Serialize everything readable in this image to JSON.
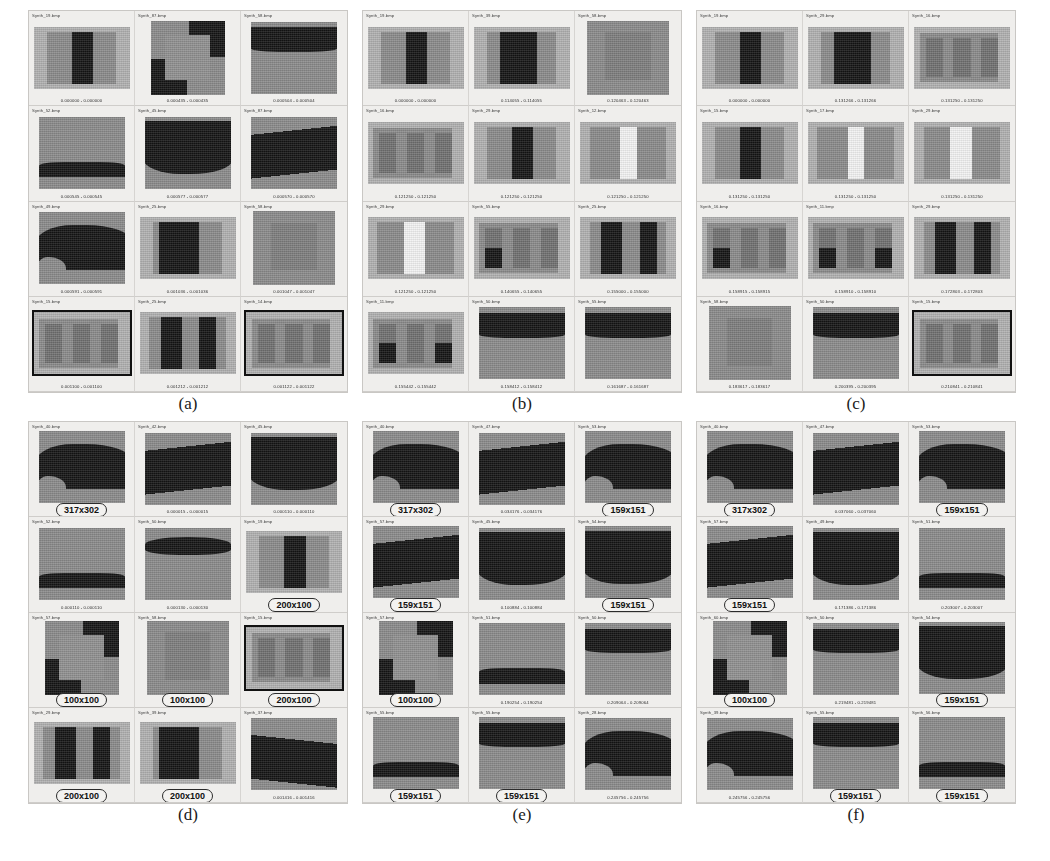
{
  "figure": {
    "colors": {
      "page_background": "#ffffff",
      "panel_background": "#efeeec",
      "panel_border": "#c9c7c4",
      "image_background": "#b0b0b0",
      "region_mid": "#8a8a8a",
      "region_dark": "#141414",
      "region_white": "#f2f2f2",
      "callout_border": "#2b2b2b",
      "selection_border": "#111111"
    },
    "panels": [
      {
        "caption": "(a)",
        "cells": [
          {
            "name": "Synth_19.bmp",
            "score": "0.000000 - 0.000000",
            "pattern": "stripe-dark-center",
            "selected": false
          },
          {
            "name": "Synth_87.bmp",
            "score": "0.000435 - 0.000435",
            "pattern": "bevel-frame",
            "selected": false
          },
          {
            "name": "Synth_58.bmp",
            "score": "0.000504 - 0.000504",
            "pattern": "band-top-dark",
            "selected": false
          },
          {
            "name": "Synth_52.bmp",
            "score": "0.000545 - 0.000545",
            "pattern": "band-lower-dark",
            "selected": false
          },
          {
            "name": "Synth_45.bmp",
            "score": "0.000577 - 0.000577",
            "pattern": "wave-top-dark",
            "selected": false
          },
          {
            "name": "Synth_87.bmp",
            "score": "0.000570 - 0.000570",
            "pattern": "diag-dark-upper",
            "selected": false
          },
          {
            "name": "Synth_49.bmp",
            "score": "0.000591 - 0.000591",
            "pattern": "wave-blob-dark",
            "selected": false
          },
          {
            "name": "Synth_25.bmp",
            "score": "0.001036 - 0.001036",
            "pattern": "stripe-dark-left",
            "selected": false
          },
          {
            "name": "Synth_58.bmp",
            "score": "0.001047 - 0.001047",
            "pattern": "center-square",
            "selected": false
          },
          {
            "name": "Synth_15.bmp",
            "score": "0.001100 - 0.001100",
            "pattern": "three-stripes",
            "selected": true
          },
          {
            "name": "Synth_25.bmp",
            "score": "0.001212 - 0.001212",
            "pattern": "two-dark-bars",
            "selected": false
          },
          {
            "name": "Synth_14.bmp",
            "score": "0.001122 - 0.001122",
            "pattern": "three-stripes",
            "selected": true
          }
        ]
      },
      {
        "caption": "(b)",
        "cells": [
          {
            "name": "Synth_19.bmp",
            "score": "0.000000 - 0.000000",
            "pattern": "stripe-dark-center",
            "selected": false
          },
          {
            "name": "Synth_39.bmp",
            "score": "0.114055 - 0.114055",
            "pattern": "stripe-dark-wide",
            "selected": false
          },
          {
            "name": "Synth_58.bmp",
            "score": "0.120463 - 0.120463",
            "pattern": "center-square",
            "selected": false
          },
          {
            "name": "Synth_16.bmp",
            "score": "0.121250 - 0.121250",
            "pattern": "three-stripes",
            "selected": false
          },
          {
            "name": "Synth_29.bmp",
            "score": "0.121250 - 0.121250",
            "pattern": "stripe-dark-center",
            "selected": false
          },
          {
            "name": "Synth_12.bmp",
            "score": "0.121250 - 0.121250",
            "pattern": "stripe-white-center",
            "selected": false
          },
          {
            "name": "Synth_29.bmp",
            "score": "0.121250 - 0.121250",
            "pattern": "stripe-white-wide",
            "selected": false
          },
          {
            "name": "Synth_55.bmp",
            "score": "0.140655 - 0.140655",
            "pattern": "three-stripes-corner",
            "selected": false
          },
          {
            "name": "Synth_25.bmp",
            "score": "0.155000 - 0.155000",
            "pattern": "two-dark-bars",
            "selected": false
          },
          {
            "name": "Synth_11.bmp",
            "score": "0.155442 - 0.155442",
            "pattern": "three-stripes-split",
            "selected": false
          },
          {
            "name": "Synth_50.bmp",
            "score": "0.158412 - 0.158412",
            "pattern": "band-top-dark",
            "selected": false
          },
          {
            "name": "Synth_55.bmp",
            "score": "0.161687 - 0.161687",
            "pattern": "band-top-dark",
            "selected": false
          }
        ]
      },
      {
        "caption": "(c)",
        "cells": [
          {
            "name": "Synth_19.bmp",
            "score": "0.000000 - 0.000000",
            "pattern": "stripe-dark-center",
            "selected": false
          },
          {
            "name": "Synth_29.bmp",
            "score": "0.131266 - 0.131266",
            "pattern": "stripe-dark-wide",
            "selected": false
          },
          {
            "name": "Synth_16.bmp",
            "score": "0.131250 - 0.131250",
            "pattern": "three-stripes",
            "selected": false
          },
          {
            "name": "Synth_15.bmp",
            "score": "0.131250 - 0.131250",
            "pattern": "stripe-dark-center",
            "selected": false
          },
          {
            "name": "Synth_17.bmp",
            "score": "0.131250 - 0.131250",
            "pattern": "stripe-white-center",
            "selected": false
          },
          {
            "name": "Synth_29.bmp",
            "score": "0.131250 - 0.131250",
            "pattern": "stripe-white-wide",
            "selected": false
          },
          {
            "name": "Synth_16.bmp",
            "score": "0.158915 - 0.158915",
            "pattern": "three-stripes-corner",
            "selected": false
          },
          {
            "name": "Synth_11.bmp",
            "score": "0.158910 - 0.158910",
            "pattern": "three-stripes-split",
            "selected": false
          },
          {
            "name": "Synth_29.bmp",
            "score": "0.172803 - 0.172803",
            "pattern": "two-dark-bars",
            "selected": false
          },
          {
            "name": "Synth_58.bmp",
            "score": "0.183617 - 0.183617",
            "pattern": "center-square",
            "selected": false
          },
          {
            "name": "Synth_50.bmp",
            "score": "0.200395 - 0.200395",
            "pattern": "band-top-dark",
            "selected": false
          },
          {
            "name": "Synth_15.bmp",
            "score": "0.210841 - 0.210841",
            "pattern": "three-stripes",
            "selected": true
          }
        ]
      },
      {
        "caption": "(d)",
        "cells": [
          {
            "name": "Synth_40.bmp",
            "callout": "317x302",
            "pattern": "wave-blob-dark",
            "selected": false
          },
          {
            "name": "Synth_42.bmp",
            "score": "0.000015 - 0.000015",
            "pattern": "diag-dark-upper",
            "selected": false
          },
          {
            "name": "Synth_45.bmp",
            "score": "0.000110 - 0.000110",
            "pattern": "wave-top-dark",
            "selected": false
          },
          {
            "name": "Synth_52.bmp",
            "score": "0.000110 - 0.000110",
            "pattern": "band-lower-dark",
            "selected": false
          },
          {
            "name": "Synth_50.bmp",
            "score": "0.000130 - 0.000130",
            "pattern": "band-top-wave",
            "selected": false
          },
          {
            "name": "Synth_19.bmp",
            "callout": "200x100",
            "pattern": "stripe-dark-center",
            "selected": false
          },
          {
            "name": "Synth_57.bmp",
            "callout": "100x100",
            "pattern": "bevel-frame",
            "selected": false
          },
          {
            "name": "Synth_58.bmp",
            "callout": "100x100",
            "pattern": "center-square",
            "selected": false
          },
          {
            "name": "Synth_15.bmp",
            "callout": "200x100",
            "pattern": "three-stripes",
            "selected": true
          },
          {
            "name": "Synth_29.bmp",
            "callout": "200x100",
            "pattern": "two-dark-bars",
            "selected": false
          },
          {
            "name": "Synth_39.bmp",
            "callout": "200x100",
            "pattern": "stripe-dark-left",
            "selected": false
          },
          {
            "name": "Synth_37.bmp",
            "score": "0.001416 - 0.001416",
            "pattern": "diag-dark-lower",
            "selected": false
          }
        ]
      },
      {
        "caption": "(e)",
        "cells": [
          {
            "name": "Synth_40.bmp",
            "callout": "317x302",
            "pattern": "wave-blob-dark",
            "selected": false
          },
          {
            "name": "Synth_47.bmp",
            "score": "0.034176 - 0.034176",
            "pattern": "diag-dark-upper",
            "selected": false
          },
          {
            "name": "Synth_53.bmp",
            "callout": "159x151",
            "pattern": "wave-blob-dark",
            "selected": false
          },
          {
            "name": "Synth_57.bmp",
            "callout": "159x151",
            "pattern": "diag-dark-upper",
            "selected": false
          },
          {
            "name": "Synth_45.bmp",
            "score": "0.100884 - 0.100884",
            "pattern": "wave-top-dark",
            "selected": false
          },
          {
            "name": "Synth_54.bmp",
            "callout": "159x151",
            "pattern": "wave-top-dark",
            "selected": false
          },
          {
            "name": "Synth_57.bmp",
            "callout": "100x100",
            "pattern": "bevel-frame",
            "selected": false
          },
          {
            "name": "Synth_51.bmp",
            "score": "0.190254 - 0.190254",
            "pattern": "band-lower-dark",
            "selected": false
          },
          {
            "name": "Synth_50.bmp",
            "score": "0.209064 - 0.209064",
            "pattern": "band-top-dark",
            "selected": false
          },
          {
            "name": "Synth_55.bmp",
            "callout": "159x151",
            "pattern": "band-lower-dark",
            "selected": false
          },
          {
            "name": "Synth_55.bmp",
            "callout": "159x151",
            "pattern": "band-top-dark",
            "selected": false
          },
          {
            "name": "Synth_28.bmp",
            "score": "0.245756 - 0.245756",
            "pattern": "wave-blob-dark",
            "selected": false
          }
        ]
      },
      {
        "caption": "(f)",
        "cells": [
          {
            "name": "Synth_40.bmp",
            "callout": "317x302",
            "pattern": "wave-blob-dark",
            "selected": false
          },
          {
            "name": "Synth_47.bmp",
            "score": "0.037060 - 0.037060",
            "pattern": "diag-dark-upper",
            "selected": false
          },
          {
            "name": "Synth_53.bmp",
            "callout": "159x151",
            "pattern": "wave-blob-dark",
            "selected": false
          },
          {
            "name": "Synth_57.bmp",
            "callout": "159x151",
            "pattern": "diag-dark-upper",
            "selected": false
          },
          {
            "name": "Synth_49.bmp",
            "score": "0.171386 - 0.171386",
            "pattern": "wave-top-dark",
            "selected": false
          },
          {
            "name": "Synth_51.bmp",
            "score": "0.203007 - 0.203007",
            "pattern": "band-lower-dark",
            "selected": false
          },
          {
            "name": "Synth_60.bmp",
            "callout": "100x100",
            "pattern": "bevel-frame",
            "selected": false
          },
          {
            "name": "Synth_50.bmp",
            "score": "0.219481 - 0.219481",
            "pattern": "band-top-dark",
            "selected": false
          },
          {
            "name": "Synth_54.bmp",
            "callout": "159x151",
            "pattern": "wave-top-dark",
            "selected": false
          },
          {
            "name": "Synth_39.bmp",
            "score": "0.245756 - 0.245756",
            "pattern": "wave-blob-dark",
            "selected": false
          },
          {
            "name": "Synth_55.bmp",
            "callout": "159x151",
            "pattern": "band-top-dark",
            "selected": false
          },
          {
            "name": "Synth_56.bmp",
            "callout": "159x151",
            "pattern": "band-lower-dark",
            "selected": false
          }
        ]
      }
    ]
  }
}
